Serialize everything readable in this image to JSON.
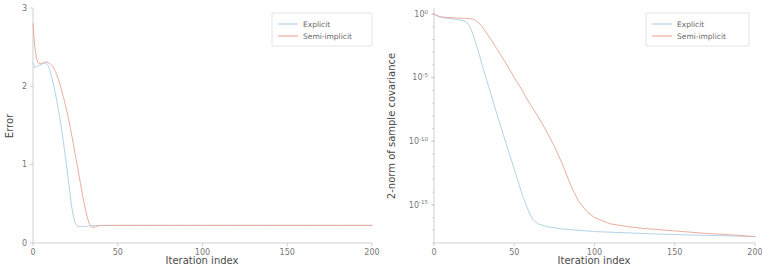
{
  "figure": {
    "panel_count": 2,
    "series_colors": {
      "explicit": "#a9cde5",
      "semi_implicit": "#e9a391"
    },
    "legend_labels": {
      "explicit": "Explicit",
      "semi_implicit": "Semi-implicit"
    }
  },
  "chart_data": [
    {
      "type": "line",
      "panel": "left",
      "title": "",
      "xlabel": "Iteration index",
      "ylabel": "Error",
      "xlim": [
        0,
        200
      ],
      "ylim": [
        0,
        3
      ],
      "yscale": "linear",
      "xscale": "linear",
      "xticks": [
        0,
        50,
        100,
        150,
        200
      ],
      "xtick_labels": [
        "0",
        "50",
        "100",
        "150",
        "200"
      ],
      "yticks": [
        0,
        1,
        2,
        3
      ],
      "ytick_labels": [
        "0",
        "1",
        "2",
        "3"
      ],
      "grid": false,
      "legend_position": "upper right",
      "legend": [
        "Explicit",
        "Semi-implicit"
      ],
      "x": [
        0,
        1,
        2,
        3,
        4,
        5,
        6,
        7,
        8,
        9,
        10,
        11,
        12,
        13,
        14,
        15,
        16,
        17,
        18,
        19,
        20,
        21,
        22,
        23,
        24,
        25,
        26,
        27,
        28,
        29,
        30,
        31,
        32,
        33,
        34,
        35,
        36,
        37,
        38,
        39,
        40,
        45,
        50,
        60,
        70,
        80,
        90,
        100,
        120,
        140,
        160,
        180,
        200
      ],
      "series": [
        {
          "name": "Explicit",
          "color": "#a9cde5",
          "values": [
            2.3,
            2.24,
            2.25,
            2.26,
            2.27,
            2.28,
            2.29,
            2.3,
            2.29,
            2.26,
            2.2,
            2.12,
            2.03,
            1.93,
            1.82,
            1.7,
            1.57,
            1.43,
            1.28,
            1.12,
            0.95,
            0.78,
            0.6,
            0.44,
            0.32,
            0.25,
            0.22,
            0.21,
            0.21,
            0.21,
            0.21,
            0.21,
            0.215,
            0.218,
            0.22,
            0.222,
            0.223,
            0.224,
            0.224,
            0.225,
            0.225,
            0.225,
            0.225,
            0.225,
            0.225,
            0.225,
            0.225,
            0.225,
            0.225,
            0.225,
            0.225,
            0.225,
            0.225
          ]
        },
        {
          "name": "Semi-implicit",
          "color": "#e9a391",
          "values": [
            2.8,
            2.52,
            2.36,
            2.3,
            2.29,
            2.29,
            2.3,
            2.31,
            2.31,
            2.3,
            2.29,
            2.27,
            2.24,
            2.2,
            2.15,
            2.09,
            2.02,
            1.94,
            1.86,
            1.77,
            1.68,
            1.58,
            1.47,
            1.36,
            1.24,
            1.12,
            1.0,
            0.88,
            0.76,
            0.64,
            0.52,
            0.42,
            0.33,
            0.26,
            0.22,
            0.2,
            0.2,
            0.21,
            0.215,
            0.22,
            0.222,
            0.224,
            0.225,
            0.225,
            0.225,
            0.225,
            0.225,
            0.225,
            0.225,
            0.225,
            0.225,
            0.225,
            0.225
          ]
        }
      ]
    },
    {
      "type": "line",
      "panel": "right",
      "title": "",
      "xlabel": "Iteration index",
      "ylabel": "2-norm of sample covariance",
      "xlim": [
        0,
        200
      ],
      "ylim": [
        1e-18,
        3
      ],
      "yscale": "log",
      "xscale": "linear",
      "xticks": [
        0,
        50,
        100,
        150,
        200
      ],
      "xtick_labels": [
        "0",
        "50",
        "100",
        "150",
        "200"
      ],
      "yticks": [
        1,
        1e-05,
        1e-10,
        1e-15
      ],
      "ytick_labels": [
        "10^0",
        "10^-5",
        "10^-10",
        "10^-15"
      ],
      "grid": false,
      "legend_position": "upper right",
      "legend": [
        "Explicit",
        "Semi-implicit"
      ],
      "x": [
        0,
        2,
        4,
        6,
        8,
        10,
        14,
        18,
        20,
        22,
        24,
        26,
        28,
        30,
        35,
        40,
        45,
        50,
        55,
        58,
        60,
        62,
        65,
        70,
        75,
        80,
        85,
        90,
        95,
        100,
        110,
        120,
        130,
        140,
        150,
        160,
        170,
        180,
        190,
        200
      ],
      "series": [
        {
          "name": "Explicit",
          "color": "#a9cde5",
          "log10_values": [
            0.0,
            -0.15,
            -0.25,
            -0.3,
            -0.33,
            -0.36,
            -0.42,
            -0.5,
            -0.6,
            -0.9,
            -1.5,
            -2.3,
            -3.1,
            -4.0,
            -6.1,
            -8.2,
            -10.2,
            -12.2,
            -14.2,
            -15.2,
            -15.8,
            -16.2,
            -16.5,
            -16.7,
            -16.8,
            -16.9,
            -16.95,
            -17.0,
            -17.05,
            -17.1,
            -17.15,
            -17.2,
            -17.25,
            -17.3,
            -17.33,
            -17.37,
            -17.4,
            -17.43,
            -17.46,
            -17.5
          ]
        },
        {
          "name": "Semi-implicit",
          "color": "#e9a391",
          "log10_values": [
            0.0,
            -0.13,
            -0.2,
            -0.24,
            -0.26,
            -0.28,
            -0.31,
            -0.33,
            -0.34,
            -0.36,
            -0.4,
            -0.5,
            -0.7,
            -1.0,
            -1.9,
            -2.9,
            -3.9,
            -5.0,
            -6.0,
            -6.7,
            -7.1,
            -7.5,
            -8.1,
            -9.2,
            -10.4,
            -11.8,
            -13.4,
            -14.7,
            -15.5,
            -16.0,
            -16.5,
            -16.7,
            -16.85,
            -16.95,
            -17.05,
            -17.15,
            -17.25,
            -17.32,
            -17.4,
            -17.5
          ]
        }
      ]
    }
  ]
}
